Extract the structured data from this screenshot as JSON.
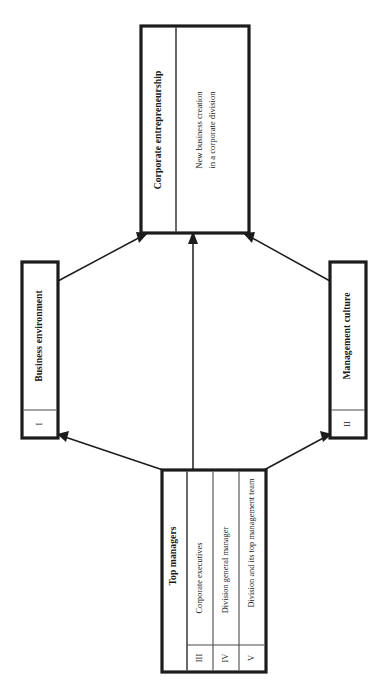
{
  "diagram": {
    "orientation": "rotated-90-ccw",
    "colors": {
      "border": "#1c1c1c",
      "inner_rule": "#4a4a4a",
      "text": "#1a1a1a",
      "background": "#ffffff"
    },
    "nodes": {
      "corporate_entrepreneurship": {
        "header": "Corporate entrepreneurship",
        "body_line1": "New business creation",
        "body_line2": "in a corporate division"
      },
      "business_environment": {
        "numeral": "I",
        "label": "Business environment"
      },
      "management_culture": {
        "numeral": "II",
        "label": "Management culture"
      },
      "top_managers": {
        "header": "Top managers",
        "rows": [
          {
            "numeral": "III",
            "label": "Corporate executives"
          },
          {
            "numeral": "IV",
            "label": "Division general manager"
          },
          {
            "numeral": "V",
            "label": "Division and its top management team"
          }
        ]
      }
    },
    "connections": [
      {
        "from": "business_environment",
        "to": "corporate_entrepreneurship",
        "style": "arrow"
      },
      {
        "from": "management_culture",
        "to": "corporate_entrepreneurship",
        "style": "arrow"
      },
      {
        "from": "top_managers",
        "to": "corporate_entrepreneurship",
        "style": "arrow"
      },
      {
        "from": "top_managers",
        "to": "business_environment",
        "style": "arrow"
      },
      {
        "from": "top_managers",
        "to": "management_culture",
        "style": "arrow"
      }
    ]
  }
}
